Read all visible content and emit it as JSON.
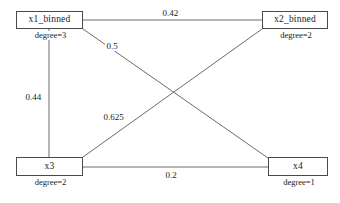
{
  "diagram": {
    "type": "undirected-weighted-graph",
    "background_color": "#ffffff",
    "line_color": "#6b6b6b",
    "node_border_color": "#4a4a4a",
    "text_color": "#1a1a1a",
    "nodes": [
      {
        "id": "x1",
        "label": "x1_binned",
        "degree_text": "degree=3",
        "degree": 3
      },
      {
        "id": "x2",
        "label": "x2_binned",
        "degree_text": "degree=2",
        "degree": 2
      },
      {
        "id": "x3",
        "label": "x3",
        "degree_text": "degree=2",
        "degree": 2
      },
      {
        "id": "x4",
        "label": "x4",
        "degree_text": "degree=1",
        "degree": 1
      }
    ],
    "edges": [
      {
        "id": "e1",
        "source": "x1",
        "target": "x2",
        "weight_text": "0.42",
        "weight": 0.42
      },
      {
        "id": "e2",
        "source": "x1",
        "target": "x4",
        "weight_text": "0.5",
        "weight": 0.5
      },
      {
        "id": "e3",
        "source": "x1",
        "target": "x3",
        "weight_text": "0.44",
        "weight": 0.44
      },
      {
        "id": "e4",
        "source": "x3",
        "target": "x2",
        "weight_text": "0.625",
        "weight": 0.625
      },
      {
        "id": "e5",
        "source": "x3",
        "target": "x4",
        "weight_text": "0.2",
        "weight": 0.2
      }
    ]
  }
}
